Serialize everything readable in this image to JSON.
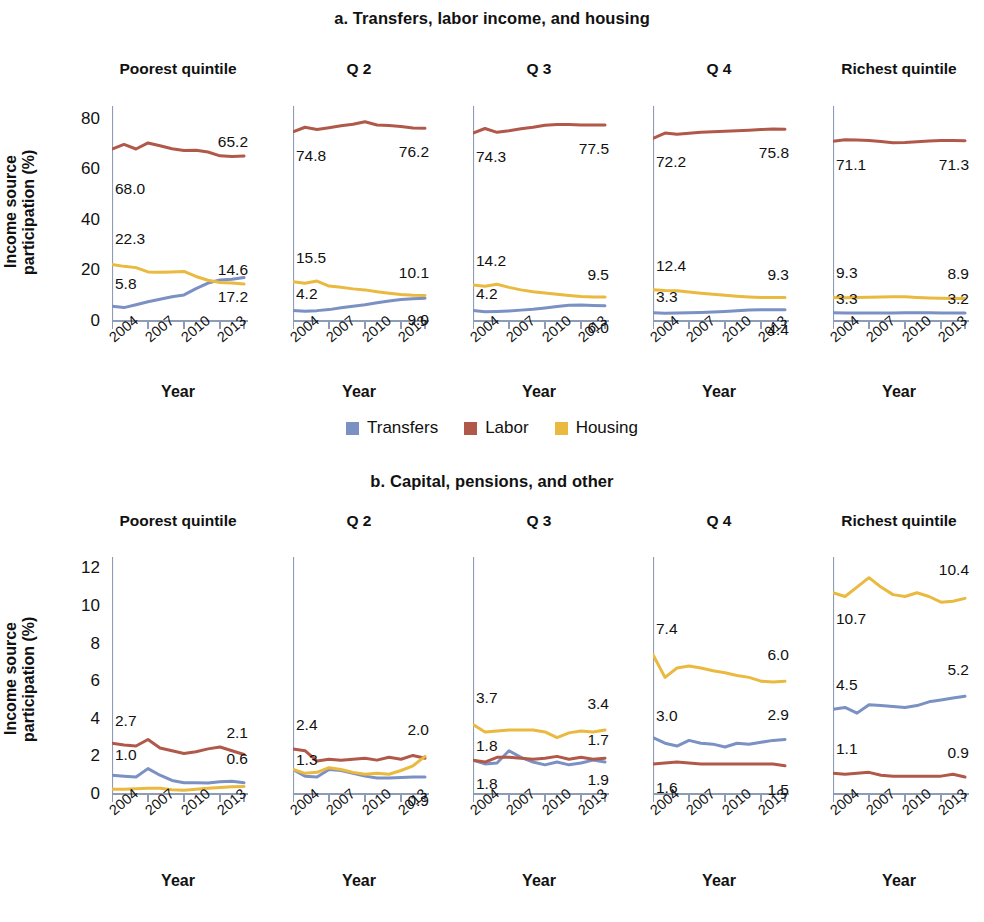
{
  "colors": {
    "blue": "#7b91c4",
    "red": "#b0594a",
    "yellow": "#eab93f",
    "axis": "#8e9cb6",
    "text": "#111111"
  },
  "panel_a": {
    "title": "a. Transfers, labor income, and housing",
    "ylabel": "Income source\nparticipation (%)",
    "xlabel": "Year",
    "yticks": [
      "0",
      "20",
      "40",
      "60",
      "80"
    ],
    "xticks": [
      "2004",
      "2007",
      "2010",
      "2013"
    ],
    "legend": [
      {
        "label": "Transfers",
        "color": "#7b91c4"
      },
      {
        "label": "Labor",
        "color": "#b0594a"
      },
      {
        "label": "Housing",
        "color": "#eab93f"
      }
    ]
  },
  "panel_b": {
    "title": "b. Capital, pensions, and other",
    "ylabel": "Income source\nparticipation (%)",
    "xlabel": "Year",
    "yticks": [
      "0",
      "2",
      "4",
      "6",
      "8",
      "10",
      "12"
    ],
    "xticks": [
      "2004",
      "2007",
      "2010",
      "2013"
    ],
    "legend": [
      {
        "label": "Capital",
        "color": "#7b91c4"
      },
      {
        "label": "Other",
        "color": "#b0594a"
      },
      {
        "label": "Pension",
        "color": "#eab93f"
      }
    ]
  },
  "chart_data": [
    {
      "type": "line",
      "title": "a. Transfers, labor income, and housing",
      "xlabel": "Year",
      "ylabel": "Income source participation (%)",
      "ylim": [
        0,
        85
      ],
      "yticks": [
        0,
        20,
        40,
        60,
        80
      ],
      "x": [
        2004,
        2005,
        2006,
        2007,
        2008,
        2009,
        2010,
        2011,
        2012,
        2013,
        2014,
        2015
      ],
      "xtick_labels": [
        "2004",
        "2007",
        "2010",
        "2013"
      ],
      "grid": false,
      "legend_position": "bottom",
      "panels": [
        {
          "name": "Poorest quintile",
          "series": [
            {
              "name": "Transfers",
              "color": "#7b91c4",
              "values": [
                5.8,
                5.3,
                6.4,
                7.6,
                8.6,
                9.6,
                10.3,
                12.8,
                15.0,
                16.2,
                16.5,
                17.2
              ],
              "first_label": "5.8",
              "last_label": "17.2"
            },
            {
              "name": "Labor",
              "color": "#b0594a",
              "values": [
                68.0,
                69.8,
                68.0,
                70.4,
                69.3,
                68.1,
                67.4,
                67.5,
                66.8,
                65.3,
                65.0,
                65.2
              ],
              "first_label": "68.0",
              "last_label": "65.2"
            },
            {
              "name": "Housing",
              "color": "#eab93f",
              "values": [
                22.3,
                21.6,
                21.1,
                19.4,
                19.3,
                19.4,
                19.6,
                17.6,
                16.1,
                15.2,
                15.0,
                14.6
              ],
              "first_label": "22.3",
              "last_label": "14.6"
            }
          ]
        },
        {
          "name": "Q 2",
          "series": [
            {
              "name": "Transfers",
              "color": "#7b91c4",
              "values": [
                4.2,
                3.9,
                4.1,
                4.5,
                5.2,
                5.8,
                6.4,
                7.2,
                7.9,
                8.5,
                8.8,
                9.0
              ],
              "first_label": "4.2",
              "last_label": "9.0"
            },
            {
              "name": "Labor",
              "color": "#b0594a",
              "values": [
                74.8,
                76.6,
                75.7,
                76.4,
                77.2,
                77.8,
                78.8,
                77.5,
                77.3,
                76.9,
                76.3,
                76.2
              ],
              "first_label": "74.8",
              "last_label": "76.2"
            },
            {
              "name": "Housing",
              "color": "#eab93f",
              "values": [
                15.5,
                14.9,
                15.8,
                13.8,
                13.3,
                12.7,
                12.3,
                11.6,
                11.0,
                10.5,
                10.2,
                10.1
              ],
              "first_label": "15.5",
              "last_label": "10.1"
            }
          ]
        },
        {
          "name": "Q 3",
          "series": [
            {
              "name": "Transfers",
              "color": "#7b91c4",
              "values": [
                4.2,
                3.7,
                3.8,
                4.0,
                4.3,
                4.6,
                5.1,
                5.7,
                6.2,
                6.3,
                6.1,
                6.0
              ],
              "first_label": "4.2",
              "last_label": "6.0"
            },
            {
              "name": "Labor",
              "color": "#b0594a",
              "values": [
                74.3,
                76.1,
                74.6,
                75.2,
                76.0,
                76.6,
                77.4,
                77.7,
                77.7,
                77.5,
                77.5,
                77.5
              ],
              "first_label": "74.3",
              "last_label": "77.5"
            },
            {
              "name": "Housing",
              "color": "#eab93f",
              "values": [
                14.2,
                13.7,
                14.5,
                13.3,
                12.3,
                11.6,
                11.1,
                10.6,
                10.1,
                9.7,
                9.5,
                9.5
              ],
              "first_label": "14.2",
              "last_label": "9.5"
            }
          ]
        },
        {
          "name": "Q 4",
          "series": [
            {
              "name": "Transfers",
              "color": "#7b91c4",
              "values": [
                3.3,
                3.1,
                3.2,
                3.3,
                3.4,
                3.6,
                3.8,
                4.1,
                4.3,
                4.4,
                4.4,
                4.4
              ],
              "first_label": "3.3",
              "last_label": "4.4"
            },
            {
              "name": "Labor",
              "color": "#b0594a",
              "values": [
                72.2,
                74.3,
                73.8,
                74.2,
                74.6,
                74.8,
                75.0,
                75.2,
                75.4,
                75.7,
                75.9,
                75.8
              ],
              "first_label": "72.2",
              "last_label": "75.8"
            },
            {
              "name": "Housing",
              "color": "#eab93f",
              "values": [
                12.4,
                12.1,
                12.0,
                11.5,
                11.0,
                10.6,
                10.2,
                9.8,
                9.5,
                9.3,
                9.3,
                9.3
              ],
              "first_label": "12.4",
              "last_label": "9.3"
            }
          ]
        },
        {
          "name": "Richest quintile",
          "series": [
            {
              "name": "Transfers",
              "color": "#7b91c4",
              "values": [
                3.3,
                3.2,
                3.2,
                3.2,
                3.2,
                3.2,
                3.3,
                3.3,
                3.3,
                3.2,
                3.2,
                3.2
              ],
              "first_label": "3.3",
              "last_label": "3.2"
            },
            {
              "name": "Labor",
              "color": "#b0594a",
              "values": [
                71.1,
                71.7,
                71.6,
                71.4,
                71.0,
                70.5,
                70.6,
                70.9,
                71.2,
                71.4,
                71.4,
                71.3
              ],
              "first_label": "71.1",
              "last_label": "71.3"
            },
            {
              "name": "Housing",
              "color": "#eab93f",
              "values": [
                9.3,
                9.2,
                9.3,
                9.4,
                9.5,
                9.6,
                9.6,
                9.3,
                9.1,
                9.0,
                8.9,
                8.9
              ],
              "first_label": "9.3",
              "last_label": "8.9"
            }
          ]
        }
      ]
    },
    {
      "type": "line",
      "title": "b. Capital, pensions, and other",
      "xlabel": "Year",
      "ylabel": "Income source participation (%)",
      "ylim": [
        0,
        12.6
      ],
      "yticks": [
        0,
        2,
        4,
        6,
        8,
        10,
        12
      ],
      "x": [
        2004,
        2005,
        2006,
        2007,
        2008,
        2009,
        2010,
        2011,
        2012,
        2013,
        2014,
        2015
      ],
      "xtick_labels": [
        "2004",
        "2007",
        "2010",
        "2013"
      ],
      "grid": false,
      "legend_position": "bottom",
      "panels": [
        {
          "name": "Poorest quintile",
          "series": [
            {
              "name": "Capital",
              "color": "#7b91c4",
              "values": [
                1.0,
                0.95,
                0.9,
                1.35,
                1.0,
                0.72,
                0.6,
                0.6,
                0.58,
                0.65,
                0.68,
                0.6
              ],
              "first_label": "1.0",
              "last_label": "0.6"
            },
            {
              "name": "Other",
              "color": "#b0594a",
              "values": [
                2.7,
                2.6,
                2.55,
                2.9,
                2.45,
                2.3,
                2.15,
                2.25,
                2.4,
                2.5,
                2.3,
                2.1
              ],
              "first_label": "2.7",
              "last_label": "2.1"
            },
            {
              "name": "Pension",
              "color": "#eab93f",
              "values": [
                0.25,
                0.25,
                0.28,
                0.3,
                0.3,
                0.22,
                0.2,
                0.25,
                0.3,
                0.35,
                0.38,
                0.4
              ],
              "first_label": null,
              "last_label": null
            }
          ]
        },
        {
          "name": "Q 2",
          "series": [
            {
              "name": "Capital",
              "color": "#7b91c4",
              "values": [
                1.3,
                0.95,
                0.9,
                1.3,
                1.25,
                1.1,
                0.95,
                0.85,
                0.85,
                0.88,
                0.9,
                0.9
              ],
              "first_label": "1.3",
              "last_label": "0.9"
            },
            {
              "name": "Other",
              "color": "#b0594a",
              "values": [
                2.4,
                2.3,
                1.75,
                1.85,
                1.8,
                1.85,
                1.9,
                1.8,
                1.95,
                1.85,
                2.05,
                1.9
              ],
              "first_label": "2.4",
              "last_label": null
            },
            {
              "name": "Pension",
              "color": "#eab93f",
              "values": [
                1.3,
                1.1,
                1.15,
                1.4,
                1.3,
                1.15,
                1.05,
                1.1,
                1.05,
                1.25,
                1.5,
                2.0
              ],
              "first_label": null,
              "last_label": "2.0"
            }
          ]
        },
        {
          "name": "Q 3",
          "series": [
            {
              "name": "Capital",
              "color": "#7b91c4",
              "values": [
                1.8,
                1.6,
                1.65,
                2.3,
                1.95,
                1.7,
                1.55,
                1.7,
                1.55,
                1.65,
                1.8,
                1.7
              ],
              "first_label": "1.8",
              "last_label": "1.7"
            },
            {
              "name": "Other",
              "color": "#b0594a",
              "values": [
                1.8,
                1.7,
                1.95,
                1.95,
                1.9,
                1.85,
                1.9,
                2.0,
                1.85,
                1.95,
                1.85,
                1.9
              ],
              "first_label": "1.8",
              "last_label": "1.9"
            },
            {
              "name": "Pension",
              "color": "#eab93f",
              "values": [
                3.7,
                3.3,
                3.35,
                3.4,
                3.4,
                3.4,
                3.3,
                3.0,
                3.25,
                3.35,
                3.3,
                3.4
              ],
              "first_label": "3.7",
              "last_label": "3.4"
            }
          ]
        },
        {
          "name": "Q 4",
          "series": [
            {
              "name": "Capital",
              "color": "#7b91c4",
              "values": [
                3.0,
                2.7,
                2.55,
                2.85,
                2.7,
                2.65,
                2.5,
                2.7,
                2.65,
                2.75,
                2.85,
                2.9
              ],
              "first_label": "3.0",
              "last_label": "2.9"
            },
            {
              "name": "Other",
              "color": "#b0594a",
              "values": [
                1.6,
                1.65,
                1.7,
                1.65,
                1.6,
                1.6,
                1.6,
                1.6,
                1.6,
                1.6,
                1.6,
                1.5
              ],
              "first_label": "1.6",
              "last_label": "1.5"
            },
            {
              "name": "Pension",
              "color": "#eab93f",
              "values": [
                7.4,
                6.2,
                6.7,
                6.8,
                6.7,
                6.55,
                6.45,
                6.3,
                6.2,
                6.0,
                5.95,
                6.0
              ],
              "first_label": "7.4",
              "last_label": "6.0"
            }
          ]
        },
        {
          "name": "Richest quintile",
          "series": [
            {
              "name": "Capital",
              "color": "#7b91c4",
              "values": [
                4.5,
                4.6,
                4.3,
                4.75,
                4.7,
                4.65,
                4.6,
                4.7,
                4.9,
                5.0,
                5.1,
                5.2
              ],
              "first_label": "4.5",
              "last_label": "5.2"
            },
            {
              "name": "Other",
              "color": "#b0594a",
              "values": [
                1.1,
                1.05,
                1.1,
                1.15,
                1.0,
                0.95,
                0.95,
                0.95,
                0.95,
                0.95,
                1.05,
                0.9
              ],
              "first_label": "1.1",
              "last_label": "0.9"
            },
            {
              "name": "Pension",
              "color": "#eab93f",
              "values": [
                10.7,
                10.5,
                11.0,
                11.5,
                11.0,
                10.6,
                10.5,
                10.7,
                10.5,
                10.2,
                10.25,
                10.4
              ],
              "first_label": "10.7",
              "last_label": "10.4"
            }
          ]
        }
      ]
    }
  ]
}
